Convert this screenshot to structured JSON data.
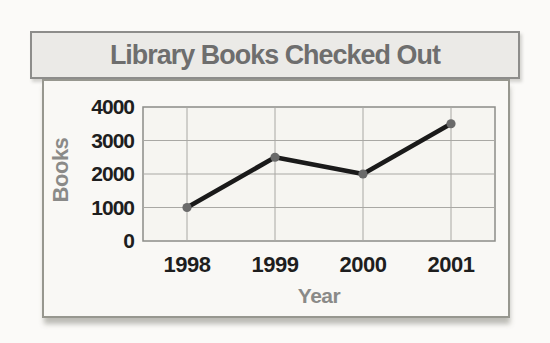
{
  "title_bar": {
    "text": "Library Books Checked Out",
    "bg": "#ebeae7",
    "border_color": "#8d8d8b",
    "text_color": "#6e6e6e"
  },
  "chart_data": {
    "type": "line",
    "title": "Library Books Checked Out",
    "xlabel": "Year",
    "ylabel": "Books",
    "categories": [
      "1998",
      "1999",
      "2000",
      "2001"
    ],
    "values": [
      1000,
      2500,
      2000,
      3500
    ],
    "yticks": [
      0,
      1000,
      2000,
      3000,
      4000
    ],
    "ylim": [
      0,
      4000
    ],
    "grid": true,
    "legend": "none",
    "colors": {
      "line": "#1a1a1a",
      "marker": "#6a6a6a",
      "grid": "#a9a8a4",
      "plot_border": "#8c8c88",
      "plot_bg": "#f6f5f1",
      "tick_label": "#1e1e1e",
      "axis_title": "#8a8a88"
    }
  }
}
